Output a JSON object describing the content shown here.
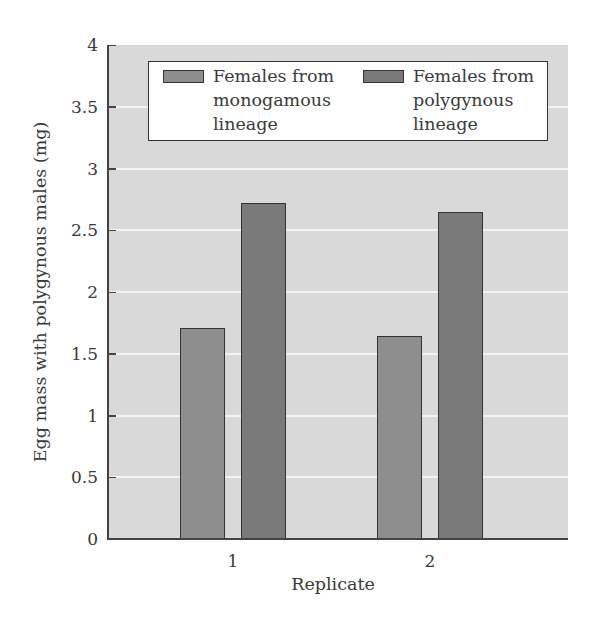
{
  "chart_data": {
    "type": "bar",
    "title": "",
    "xlabel": "Replicate",
    "ylabel": "Egg mass with polygynous males (mg)",
    "categories": [
      "1",
      "2"
    ],
    "series": [
      {
        "name": "Females from monogamous lineage",
        "values": [
          1.71,
          1.64
        ],
        "color": "#8e8e8e"
      },
      {
        "name": "Females from polygynous lineage",
        "values": [
          2.72,
          2.65
        ],
        "color": "#7a7a7a"
      }
    ],
    "ylim": [
      0,
      4
    ],
    "yticks": [
      "0",
      "0.5",
      "1",
      "1.5",
      "2",
      "2.5",
      "3",
      "3.5",
      "4"
    ],
    "grid": true,
    "legend_position": "top (inside plot)",
    "background_color": "#d9d9d9"
  },
  "legend": {
    "items": [
      {
        "label": "Females from\nmonogamous\nlineage",
        "color": "#8e8e8e"
      },
      {
        "label": "Females from\npolygynous\nlineage",
        "color": "#7a7a7a"
      }
    ]
  }
}
